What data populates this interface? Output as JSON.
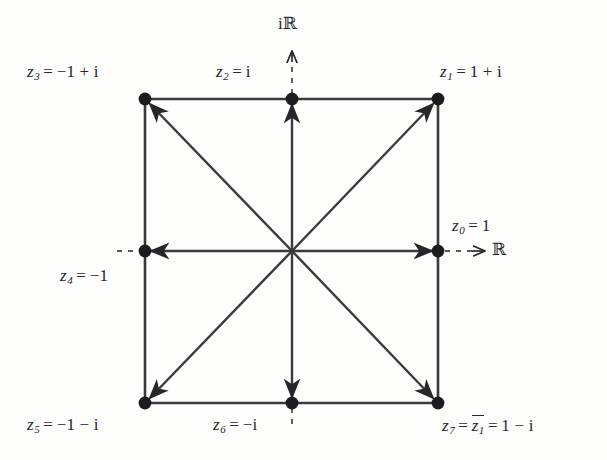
{
  "figure": {
    "type": "complex-plane-diagram",
    "background_color": "#fdfdfc",
    "ink_color": "#26262b"
  },
  "axes": {
    "imaginary": {
      "label": "iℝ",
      "label_parts": {
        "prefix": "i",
        "blackboard": "ℝ"
      },
      "direction": "up",
      "style": "dashed-with-arrow"
    },
    "real": {
      "label": "ℝ",
      "direction": "right",
      "style": "dashed-with-arrow"
    }
  },
  "vertices": [
    {
      "id": "z0",
      "name": "z0",
      "label": "z₀ = 1",
      "subscript": "0",
      "value_text": "1",
      "x": 438,
      "y": 251,
      "label_x": 452,
      "label_y": 216,
      "position": "right"
    },
    {
      "id": "z1",
      "name": "z1",
      "label": "z₁ = 1 + i",
      "subscript": "1",
      "value_text": "1 + i",
      "x": 438,
      "y": 99,
      "label_x": 440,
      "label_y": 62,
      "position": "top-right"
    },
    {
      "id": "z2",
      "name": "z2",
      "label": "z₂ = i",
      "subscript": "2",
      "value_text": "i",
      "x": 292,
      "y": 99,
      "label_x": 216,
      "label_y": 62,
      "position": "top"
    },
    {
      "id": "z3",
      "name": "z3",
      "label": "z₃ = −1 + i",
      "subscript": "3",
      "value_text": "−1 + i",
      "x": 145,
      "y": 99,
      "label_x": 27,
      "label_y": 62,
      "position": "top-left"
    },
    {
      "id": "z4",
      "name": "z4",
      "label": "z₄ = −1",
      "subscript": "4",
      "value_text": "−1",
      "x": 145,
      "y": 251,
      "label_x": 60,
      "label_y": 266,
      "position": "left"
    },
    {
      "id": "z5",
      "name": "z5",
      "label": "z₅ = −1 − i",
      "subscript": "5",
      "value_text": "−1 − i",
      "x": 145,
      "y": 403,
      "label_x": 27,
      "label_y": 415,
      "position": "bottom-left"
    },
    {
      "id": "z6",
      "name": "z6",
      "label": "z₆ = −i",
      "subscript": "6",
      "value_text": "−i",
      "x": 292,
      "y": 403,
      "label_x": 213,
      "label_y": 415,
      "position": "bottom"
    },
    {
      "id": "z7",
      "name": "z7",
      "label": "z₇ = z̄₁ = 1 − i",
      "subscript": "7",
      "conjugate_of": "z1",
      "value_text": "1 − i",
      "x": 438,
      "y": 403,
      "label_x": 442,
      "label_y": 415,
      "position": "bottom-right"
    }
  ],
  "center": {
    "x": 292,
    "y": 251
  },
  "symbols": {
    "equals": "=",
    "plus": "+",
    "minus": "−",
    "i": "i",
    "one": "1",
    "blackboard_r": "ℝ",
    "z": "z"
  }
}
